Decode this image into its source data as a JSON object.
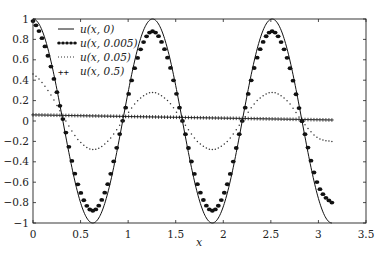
{
  "chart_data": {
    "type": "line",
    "title": "",
    "xlabel": "x",
    "ylabel": "",
    "xlim": [
      0,
      3.5
    ],
    "ylim": [
      -1,
      1
    ],
    "xticks": [
      0,
      0.5,
      1,
      1.5,
      2,
      2.5,
      3,
      3.5
    ],
    "xtick_labels": [
      "0",
      "0.5",
      "1",
      "1.5",
      "2",
      "2.5",
      "3",
      "3.5"
    ],
    "yticks": [
      1,
      0.8,
      0.6,
      0.4,
      0.2,
      0,
      -0.2,
      -0.4,
      -0.6,
      -0.8,
      -1
    ],
    "ytick_labels": [
      "1",
      "0.8",
      "0.6",
      "0.4",
      "0.2",
      "0",
      "−0.2",
      "−0.4",
      "−0.6",
      "−0.8",
      "−1"
    ],
    "grid": false,
    "legend_position": "upper left",
    "x_domain": [
      0,
      3.14159
    ],
    "series": [
      {
        "name": "u(x, 0)",
        "legend_label": "u(x, 0)",
        "style": "solid",
        "description": "cos(5x) on [0, π]",
        "x": [
          0,
          0.157,
          0.314,
          0.471,
          0.628,
          0.785,
          0.942,
          1.1,
          1.257,
          1.414,
          1.571,
          1.728,
          1.885,
          2.042,
          2.199,
          2.356,
          2.513,
          2.67,
          2.827,
          2.985,
          3.142
        ],
        "values": [
          1,
          0.707,
          0,
          -0.707,
          -1,
          -0.707,
          0,
          0.707,
          1,
          0.707,
          0,
          -0.707,
          -1,
          -0.707,
          0,
          0.707,
          1,
          0.707,
          0,
          -0.707,
          -1
        ]
      },
      {
        "name": "u(x, 0.005)",
        "legend_label": "u(x, 0.005)",
        "style": "filled-dots",
        "x": [
          0,
          0.157,
          0.314,
          0.471,
          0.628,
          0.785,
          0.942,
          1.1,
          1.257,
          1.414,
          1.571,
          1.728,
          1.885,
          2.042,
          2.199,
          2.356,
          2.513,
          2.67,
          2.827,
          2.985,
          3.142
        ],
        "values": [
          0.98,
          0.64,
          0.02,
          -0.62,
          -0.88,
          -0.62,
          0.0,
          0.62,
          0.88,
          0.62,
          0.0,
          -0.62,
          -0.88,
          -0.62,
          0.0,
          0.62,
          0.88,
          0.62,
          0.0,
          -0.6,
          -0.8
        ]
      },
      {
        "name": "u(x, 0.05)",
        "legend_label": "u(x, 0.05)",
        "style": "dotted",
        "x": [
          0,
          0.157,
          0.314,
          0.471,
          0.628,
          0.785,
          0.942,
          1.1,
          1.257,
          1.414,
          1.571,
          1.728,
          1.885,
          2.042,
          2.199,
          2.356,
          2.513,
          2.67,
          2.827,
          2.985,
          3.142
        ],
        "values": [
          0.46,
          0.3,
          0.05,
          -0.18,
          -0.28,
          -0.2,
          0.0,
          0.2,
          0.28,
          0.2,
          0.0,
          -0.2,
          -0.28,
          -0.2,
          0.0,
          0.2,
          0.28,
          0.2,
          0.0,
          -0.16,
          -0.2
        ]
      },
      {
        "name": "u(x, 0.5)",
        "legend_label": "u(x, 0.5)",
        "style": "plus-markers",
        "x": [
          0,
          3.142
        ],
        "values": [
          0.06,
          0.01
        ]
      }
    ]
  },
  "legend": {
    "items": [
      {
        "label": "u(x, 0)",
        "style": "solid"
      },
      {
        "label": "u(x, 0.005)",
        "style": "filled-dots"
      },
      {
        "label": "u(x, 0.05)",
        "style": "dotted"
      },
      {
        "label": "u(x, 0.5)",
        "style": "plus-markers"
      }
    ]
  },
  "axes": {
    "x_label": "x"
  },
  "colors": {
    "line": "#111111",
    "axis": "#222222",
    "background": "#ffffff"
  }
}
